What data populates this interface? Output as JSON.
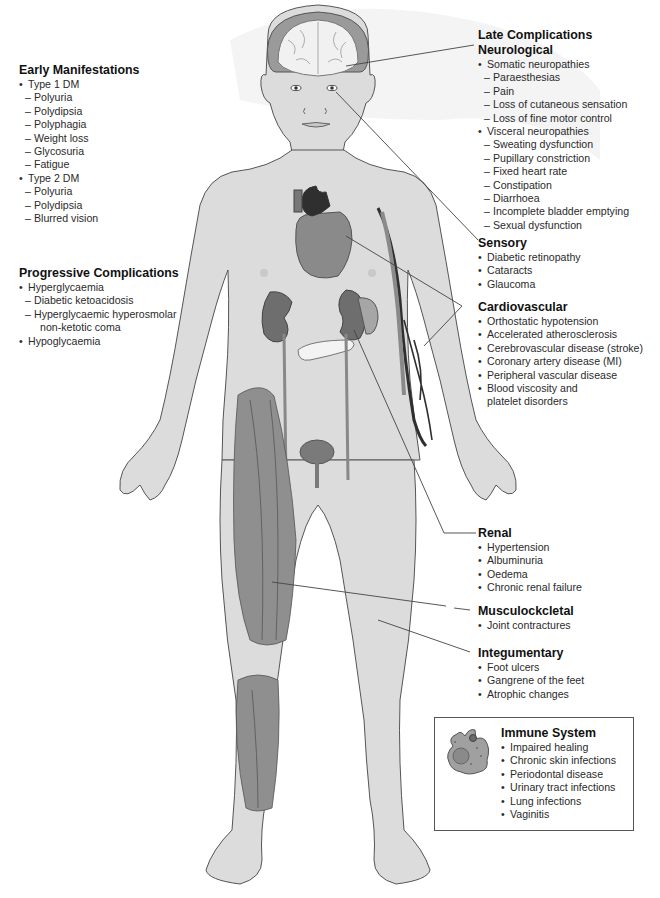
{
  "colors": {
    "skin": "#dcdcdc",
    "outline": "#555555",
    "organ": "#8a8a8a",
    "organ_dark": "#2f2f2f",
    "muscle": "#8f8f8f",
    "hair": "#9a9a9a",
    "leader_line": "#444444",
    "backdrop": "#f2f2f2"
  },
  "left": {
    "early": {
      "title": "Early Manifestations",
      "groups": [
        {
          "label": "Type 1 DM",
          "items": [
            "Polyuria",
            "Polydipsia",
            "Polyphagia",
            "Weight loss",
            "Glycosuria",
            "Fatigue"
          ]
        },
        {
          "label": "Type 2 DM",
          "items": [
            "Polyuria",
            "Polydipsia",
            "Blurred vision"
          ]
        }
      ]
    },
    "progressive": {
      "title": "Progressive Complications",
      "groups": [
        {
          "label": "Hyperglycaemia",
          "items": [
            "Diabetic ketoacidosis",
            "Hyperglycaemic hyperosmolar",
            "non-ketotic coma"
          ]
        },
        {
          "label": "Hypoglycaemia",
          "items": []
        }
      ]
    }
  },
  "right": {
    "late_title": "Late Complications",
    "neurological": {
      "title": "Neurological",
      "groups": [
        {
          "label": "Somatic neuropathies",
          "items": [
            "Paraesthesias",
            "Pain",
            "Loss of cutaneous sensation",
            "Loss of fine motor control"
          ]
        },
        {
          "label": "Visceral neuropathies",
          "items": [
            "Sweating dysfunction",
            "Pupillary constriction",
            "Fixed heart rate",
            "Constipation",
            "Diarrhoea",
            "Incomplete bladder emptying",
            "Sexual dysfunction"
          ]
        }
      ]
    },
    "sensory": {
      "title": "Sensory",
      "items": [
        "Diabetic retinopathy",
        "Cataracts",
        "Glaucoma"
      ]
    },
    "cardiovascular": {
      "title": "Cardiovascular",
      "items": [
        "Orthostatic hypotension",
        "Accelerated atherosclerosis",
        "Cerebrovascular disease (stroke)",
        "Coronary artery disease (MI)",
        "Peripheral vascular disease",
        "Blood viscosity and",
        "platelet disorders"
      ]
    },
    "renal": {
      "title": "Renal",
      "items": [
        "Hypertension",
        "Albuminuria",
        "Oedema",
        "Chronic renal failure"
      ]
    },
    "musculoskeletal": {
      "title": "Musculockcletal",
      "items": [
        "Joint contractures"
      ]
    },
    "integumentary": {
      "title": "Integumentary",
      "items": [
        "Foot ulcers",
        "Gangrene of the feet",
        "Atrophic changes"
      ]
    },
    "immune": {
      "title": "Immune System",
      "items": [
        "Impaired healing",
        "Chronic skin infections",
        "Periodontal disease",
        "Urinary tract infections",
        "Lung infections",
        "Vaginitis"
      ]
    }
  }
}
